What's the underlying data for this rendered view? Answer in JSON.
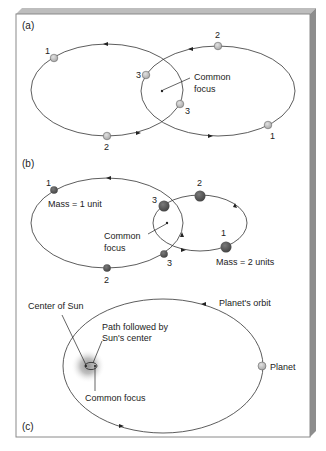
{
  "panels": {
    "a": {
      "label": "(a)",
      "common_focus_label_line1": "Common",
      "common_focus_label_line2": "focus",
      "left_orbit_points": [
        "1",
        "2",
        "3"
      ],
      "right_orbit_points": [
        "2",
        "3",
        "1"
      ]
    },
    "b": {
      "label": "(b)",
      "mass_small": "Mass = 1 unit",
      "mass_large": "Mass = 2 units",
      "common_focus_label_line1": "Common",
      "common_focus_label_line2": "focus",
      "left_orbit_points": [
        "1",
        "3",
        "2",
        "3"
      ],
      "right_orbit_points": [
        "2",
        "1"
      ]
    },
    "c": {
      "label": "(c)",
      "center_of_sun": "Center of Sun",
      "path_line1": "Path followed by",
      "path_line2": "Sun's center",
      "common_focus": "Common focus",
      "planets_orbit": "Planet's orbit",
      "planet": "Planet"
    }
  },
  "colors": {
    "panel_bg": "#ffffff",
    "panel_edge": "#8a8a8a",
    "edge_dark": "#7a7a7a",
    "orbit_line": "#333333",
    "light_body": "#c8c8c8",
    "dark_body": "#5a5a5a",
    "sun_glow": "#9a9a9a"
  }
}
